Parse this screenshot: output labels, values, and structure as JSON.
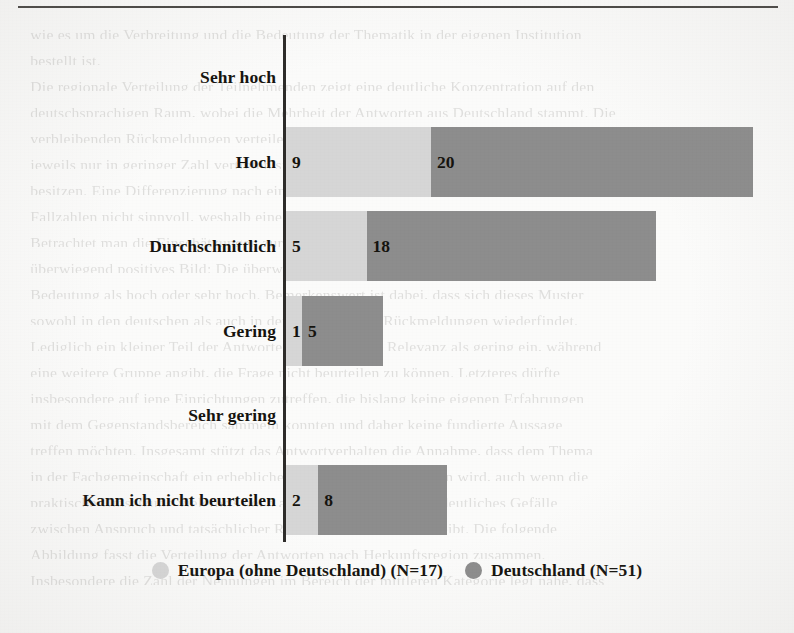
{
  "chart_data": {
    "type": "bar",
    "orientation": "horizontal",
    "grouped": true,
    "title": "",
    "subtitle": "",
    "xlabel": "",
    "ylabel": "",
    "grid": false,
    "legend_position": "bottom",
    "axis_max": 21,
    "px_per_unit": 16.1,
    "categories": [
      "Sehr hoch",
      "Hoch",
      "Durchschnittlich",
      "Gering",
      "Sehr gering",
      "Kann ich nicht beurteilen"
    ],
    "series": [
      {
        "name": "Europa (ohne Deutschland) (N=17)",
        "short_name": "Europa (ohne Deutschland)",
        "n": 17,
        "color": "#d6d6d6",
        "values": [
          0,
          9,
          5,
          1,
          0,
          2
        ]
      },
      {
        "name": "Deutschland (N=51)",
        "short_name": "Deutschland",
        "n": 51,
        "color": "#8d8d8d",
        "values": [
          0,
          20,
          18,
          5,
          0,
          8
        ]
      }
    ],
    "rows": [
      {
        "label": "Sehr hoch",
        "europa": 0,
        "europa_text": "",
        "deutschland": 0,
        "deutschland_text": ""
      },
      {
        "label": "Hoch",
        "europa": 9,
        "europa_text": "9",
        "deutschland": 20,
        "deutschland_text": "20"
      },
      {
        "label": "Durchschnittlich",
        "europa": 5,
        "europa_text": "5",
        "deutschland": 18,
        "deutschland_text": "18"
      },
      {
        "label": "Gering",
        "europa": 1,
        "europa_text": "1",
        "deutschland": 5,
        "deutschland_text": "5"
      },
      {
        "label": "Sehr gering",
        "europa": 0,
        "europa_text": "",
        "deutschland": 0,
        "deutschland_text": ""
      },
      {
        "label": "Kann ich nicht beurteilen",
        "europa": 2,
        "europa_text": "2",
        "deutschland": 8,
        "deutschland_text": "8"
      }
    ]
  },
  "legend": {
    "items": [
      {
        "label": "Europa (ohne Deutschland) (N=17)",
        "color": "#d6d6d6"
      },
      {
        "label": "Deutschland (N=51)",
        "color": "#8d8d8d"
      }
    ]
  },
  "page": {
    "background_text": [
      "wie es um die Verbreitung und die Bedeutung der Thematik in der eigenen Institution",
      "bestellt ist.",
      "Die regionale Verteilung der Teilnehmenden zeigt eine deutliche Konzentration auf den",
      "deutschsprachigen Raum, wobei die Mehrheit der Antworten aus Deutschland stammt. Die",
      "verbleibenden Rückmeldungen verteilen sich auf weitere europäische Staaten, die",
      "jeweils nur in geringer Zahl vertreten sind und daher lediglich orientierenden Charakter",
      "besitzen. Eine Differenzierung nach einzelnen Ländern ist aufgrund der geringen",
      "Fallzahlen nicht sinnvoll, weshalb eine zusammenfassende Betrachtung gewählt wurde.",
      "Betrachtet man die Einschätzungen zur Relevanz des Themas, so zeigt sich ein",
      "überwiegend positives Bild: Die überwiegende Mehrheit der Befragten beurteilt die",
      "Bedeutung als hoch oder sehr hoch. Bemerkenswert ist dabei, dass sich dieses Muster",
      "sowohl in den deutschen als auch in den europäischen Rückmeldungen wiederfindet.",
      "Lediglich ein kleiner Teil der Antwortenden ordnet die Relevanz als gering ein, während",
      "eine weitere Gruppe angibt, die Frage nicht beurteilen zu können. Letzteres dürfte",
      "insbesondere auf jene Einrichtungen zutreffen, die bislang keine eigenen Erfahrungen",
      "mit dem Gegenstandsbereich sammeln konnten und daher keine fundierte Aussage",
      "treffen möchten. Insgesamt stützt das Antwortverhalten die Annahme, dass dem Thema",
      "in der Fachgemeinschaft ein erheblicher Stellenwert beigemessen wird, auch wenn die",
      "praktische Umsetzung vielerorts noch am Anfang steht und ein deutliches Gefälle",
      "zwischen Anspruch und tatsächlicher Realisierung erkennbar bleibt. Die folgende",
      "Abbildung fasst die Verteilung der Antworten nach Herkunftsregion zusammen.",
      "Insbesondere die Zahl der Nennungen im Bereich der mittleren Kategorie legt nahe, dass"
    ]
  }
}
